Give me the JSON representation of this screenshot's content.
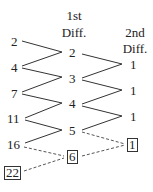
{
  "headers": {
    "first_diff": [
      "1st",
      "Diff."
    ],
    "second_diff": [
      "2nd",
      "Diff."
    ]
  },
  "sequence": [
    "2",
    "4",
    "7",
    "11",
    "16",
    "22"
  ],
  "first_differences": [
    "2",
    "3",
    "4",
    "5",
    "6"
  ],
  "second_differences": [
    "1",
    "1",
    "1",
    "1"
  ],
  "boxed": {
    "predicted_term": "22",
    "predicted_first_diff": "6",
    "predicted_second_diff": "1"
  },
  "colors": {
    "ink": "#222222",
    "dashed": "#555555"
  }
}
